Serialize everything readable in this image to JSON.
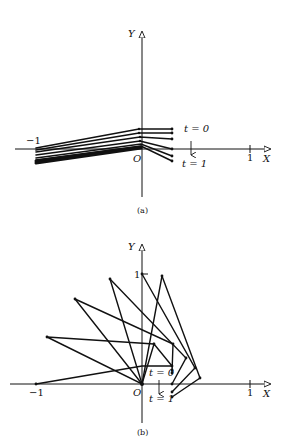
{
  "figure": {
    "panels": [
      {
        "id": "a",
        "caption": "(a)",
        "axis_x_label": "X",
        "axis_y_label": "Y",
        "origin_label": "O",
        "tick_neg_one": "−1",
        "tick_pos_one": "1",
        "t_start_label": "t = 0",
        "t_end_label": "t = 1"
      },
      {
        "id": "b",
        "caption": "(b)",
        "axis_x_label": "X",
        "axis_y_label": "Y",
        "origin_label": "O",
        "tick_neg_one": "−1",
        "tick_pos_one": "1",
        "tick_y_one": "1",
        "t_start_label": "t = 0",
        "t_end_label": "t = 1"
      }
    ]
  }
}
